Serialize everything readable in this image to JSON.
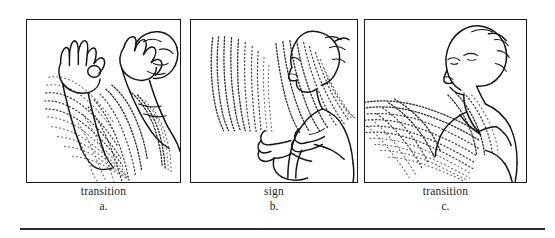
{
  "figure": {
    "type": "three-panel-line-drawing",
    "panel_count": 3,
    "has_bottom_rule": true,
    "ink_color": "#141414",
    "trail_color": "#3a3a3a",
    "background_color": "#ffffff"
  },
  "panels": [
    {
      "id": "panel-a",
      "caption_word": "transition",
      "caption_letter": "a.",
      "content": "Signer with both hands raised, left hand in F/OK handshape, right hand near the face; broad dotted motion trails sweep downward and to the left"
    },
    {
      "id": "panel-b",
      "caption_word": "sign",
      "caption_letter": "b.",
      "content": "Signer in profile facing left with both hands held in front of the chest; two fan-shaped dotted motion trails radiate upward"
    },
    {
      "id": "panel-c",
      "caption_word": "transition",
      "caption_letter": "c.",
      "content": "Signer in three-quarter view looking up and to the left; horizontal dotted motion trails sweep down and to the left across the body"
    }
  ]
}
